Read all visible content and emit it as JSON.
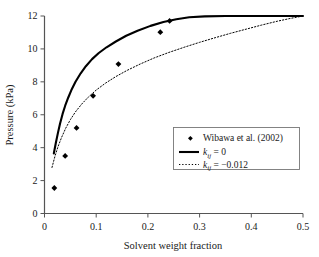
{
  "chart_data": {
    "type": "scatter",
    "title": "",
    "xlabel": "Solvent weight fraction",
    "ylabel": "Pressure (kPa)",
    "xlim": [
      0,
      0.5
    ],
    "ylim": [
      0,
      12
    ],
    "xticks": [
      "0",
      "0.1",
      "0.2",
      "0.3",
      "0.4",
      "0.5"
    ],
    "xtick_values": [
      0,
      0.1,
      0.2,
      0.3,
      0.4,
      0.5
    ],
    "yticks": [
      "0",
      "2",
      "4",
      "6",
      "8",
      "10",
      "12"
    ],
    "ytick_values": [
      0,
      2,
      4,
      6,
      8,
      10,
      12
    ],
    "grid": false,
    "legend_position": "lower right",
    "series": [
      {
        "name": "Wibawa et al. (2002)",
        "type": "scatter",
        "marker": "diamond",
        "color": "#000000",
        "points": [
          {
            "x": 0.019,
            "y": 1.55
          },
          {
            "x": 0.04,
            "y": 3.5
          },
          {
            "x": 0.062,
            "y": 5.2
          },
          {
            "x": 0.094,
            "y": 7.15
          },
          {
            "x": 0.143,
            "y": 9.08
          },
          {
            "x": 0.224,
            "y": 11.02
          },
          {
            "x": 0.242,
            "y": 11.7
          }
        ]
      },
      {
        "name": "kij = 0",
        "label_base": "k",
        "label_sub": "ij",
        "label_rest": " = 0",
        "type": "line",
        "style": "solid",
        "color": "#000000",
        "points": [
          {
            "x": 0.018,
            "y": 3.65
          },
          {
            "x": 0.022,
            "y": 4.3
          },
          {
            "x": 0.026,
            "y": 4.9
          },
          {
            "x": 0.03,
            "y": 5.45
          },
          {
            "x": 0.035,
            "y": 6.05
          },
          {
            "x": 0.04,
            "y": 6.55
          },
          {
            "x": 0.046,
            "y": 7.05
          },
          {
            "x": 0.052,
            "y": 7.5
          },
          {
            "x": 0.06,
            "y": 8.0
          },
          {
            "x": 0.07,
            "y": 8.52
          },
          {
            "x": 0.08,
            "y": 8.95
          },
          {
            "x": 0.092,
            "y": 9.38
          },
          {
            "x": 0.105,
            "y": 9.75
          },
          {
            "x": 0.12,
            "y": 10.1
          },
          {
            "x": 0.138,
            "y": 10.45
          },
          {
            "x": 0.158,
            "y": 10.8
          },
          {
            "x": 0.18,
            "y": 11.1
          },
          {
            "x": 0.205,
            "y": 11.4
          },
          {
            "x": 0.23,
            "y": 11.63
          },
          {
            "x": 0.255,
            "y": 11.8
          },
          {
            "x": 0.28,
            "y": 11.92
          },
          {
            "x": 0.31,
            "y": 11.98
          },
          {
            "x": 0.35,
            "y": 12.0
          },
          {
            "x": 0.42,
            "y": 12.0
          },
          {
            "x": 0.5,
            "y": 12.0
          }
        ]
      },
      {
        "name": "kij = -0.012",
        "label_base": "k",
        "label_sub": "ij",
        "label_rest": " = −0.012",
        "type": "line",
        "style": "dotted",
        "color": "#000000",
        "points": [
          {
            "x": 0.0145,
            "y": 2.8
          },
          {
            "x": 0.02,
            "y": 3.45
          },
          {
            "x": 0.026,
            "y": 4.05
          },
          {
            "x": 0.033,
            "y": 4.62
          },
          {
            "x": 0.041,
            "y": 5.18
          },
          {
            "x": 0.05,
            "y": 5.7
          },
          {
            "x": 0.06,
            "y": 6.18
          },
          {
            "x": 0.072,
            "y": 6.65
          },
          {
            "x": 0.085,
            "y": 7.08
          },
          {
            "x": 0.1,
            "y": 7.5
          },
          {
            "x": 0.118,
            "y": 7.92
          },
          {
            "x": 0.138,
            "y": 8.32
          },
          {
            "x": 0.16,
            "y": 8.7
          },
          {
            "x": 0.185,
            "y": 9.08
          },
          {
            "x": 0.212,
            "y": 9.45
          },
          {
            "x": 0.24,
            "y": 9.78
          },
          {
            "x": 0.27,
            "y": 10.1
          },
          {
            "x": 0.3,
            "y": 10.4
          },
          {
            "x": 0.33,
            "y": 10.68
          },
          {
            "x": 0.36,
            "y": 10.95
          },
          {
            "x": 0.39,
            "y": 11.2
          },
          {
            "x": 0.42,
            "y": 11.45
          },
          {
            "x": 0.45,
            "y": 11.68
          },
          {
            "x": 0.475,
            "y": 11.85
          },
          {
            "x": 0.5,
            "y": 12.0
          }
        ]
      }
    ]
  },
  "legend": {
    "entries": [
      {
        "marker": "diamond",
        "text": "Wibawa et al. (2002)"
      },
      {
        "marker": "solid-line",
        "text": "k",
        "sub": "ij",
        "rest": " = 0"
      },
      {
        "marker": "dotted-line",
        "text": "k",
        "sub": "ij",
        "rest": " = −0.012"
      }
    ]
  },
  "colors": {
    "axis": "#555555",
    "data": "#000000",
    "background": "#ffffff",
    "legend_border": "#777777"
  }
}
